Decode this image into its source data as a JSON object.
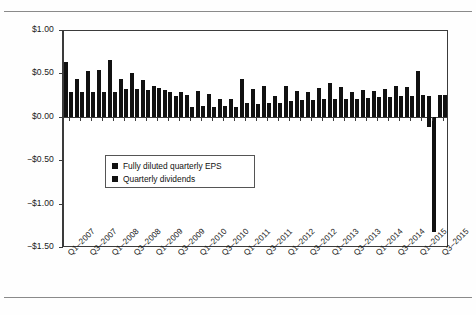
{
  "chart_data": {
    "type": "bar",
    "title": "",
    "subtitle": "",
    "xlabel": "",
    "ylabel": "",
    "ylim": [
      -1.5,
      1.0
    ],
    "ytick_values": [
      1.0,
      0.5,
      0.0,
      -0.5,
      -1.0,
      -1.5
    ],
    "ytick_labels": [
      "$1.00",
      "$0.50",
      "$0.00",
      "-$0.50",
      "-$1.00",
      "-$1.50"
    ],
    "grid": false,
    "legend_position": "inside-left",
    "categories": [
      "Q1-2007",
      "Q2-2007",
      "Q3-2007",
      "Q4-2007",
      "Q1-2008",
      "Q2-2008",
      "Q3-2008",
      "Q4-2008",
      "Q1-2009",
      "Q2-2009",
      "Q3-2009",
      "Q4-2009",
      "Q1-2010",
      "Q2-2010",
      "Q3-2010",
      "Q4-2010",
      "Q1-2011",
      "Q2-2011",
      "Q3-2011",
      "Q4-2011",
      "Q1-2012",
      "Q2-2012",
      "Q3-2012",
      "Q4-2012",
      "Q1-2013",
      "Q2-2013",
      "Q3-2013",
      "Q4-2013",
      "Q1-2014",
      "Q2-2014",
      "Q3-2014",
      "Q4-2014",
      "Q1-2015",
      "Q2-2015",
      "Q3-2015"
    ],
    "xtick_labels": [
      "Q1-2007",
      "Q3-2007",
      "Q1-2008",
      "Q3-2008",
      "Q1-2009",
      "Q3-2009",
      "Q1-2010",
      "Q3-2010",
      "Q1-2011",
      "Q3-2011",
      "Q1-2012",
      "Q3-2012",
      "Q1-2013",
      "Q3-2013",
      "Q1-2014",
      "Q3-2014",
      "Q1-2015",
      "Q3-2015"
    ],
    "xtick_indices": [
      0,
      2,
      4,
      6,
      8,
      10,
      12,
      14,
      16,
      18,
      20,
      22,
      24,
      26,
      28,
      30,
      32,
      34
    ],
    "series": [
      {
        "name": "Fully diluted quarterly EPS",
        "color": "#111111",
        "values": [
          0.63,
          0.43,
          0.53,
          0.54,
          0.66,
          0.43,
          0.51,
          0.42,
          0.35,
          0.31,
          0.24,
          0.25,
          0.3,
          0.26,
          0.21,
          0.2,
          0.43,
          0.32,
          0.36,
          0.24,
          0.36,
          0.3,
          0.28,
          0.33,
          0.39,
          0.34,
          0.29,
          0.31,
          0.3,
          0.32,
          0.36,
          0.34,
          0.53,
          0.24,
          0.25
        ]
      },
      {
        "name": "Quarterly dividends",
        "color": "#111111",
        "values": [
          0.28,
          0.28,
          0.28,
          0.28,
          0.28,
          0.32,
          0.32,
          0.31,
          0.33,
          0.28,
          0.28,
          0.11,
          0.12,
          0.11,
          0.12,
          0.11,
          0.16,
          0.15,
          0.16,
          0.16,
          0.18,
          0.19,
          0.19,
          0.2,
          0.2,
          0.21,
          0.21,
          0.22,
          0.23,
          0.23,
          0.24,
          0.24,
          0.25,
          -1.33,
          0.25
        ]
      }
    ],
    "notes": [
      "Q2-2015 dividend bar extends to approximately -$1.33",
      "A small negative bar of approximately -$0.12 appears near Q2/Q3-2015"
    ],
    "extra_negative": {
      "index": 33,
      "eps_value": -0.12
    }
  },
  "legend": {
    "items": [
      {
        "label": "Fully diluted quarterly EPS",
        "swatch": "legend-swatch-eps"
      },
      {
        "label": "Quarterly dividends",
        "swatch": "legend-swatch-dividends"
      }
    ]
  }
}
